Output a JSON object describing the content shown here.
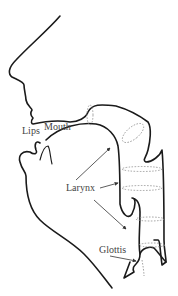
{
  "diagram": {
    "labels": {
      "lips": "Lips",
      "mouth": "Mouth",
      "larynx": "Larynx",
      "glottis": "Glottis"
    },
    "colors": {
      "outline": "#1a1a1a",
      "dashed_sections": "#8a8a8a",
      "label_text": "#444444",
      "background": "#ffffff"
    }
  }
}
